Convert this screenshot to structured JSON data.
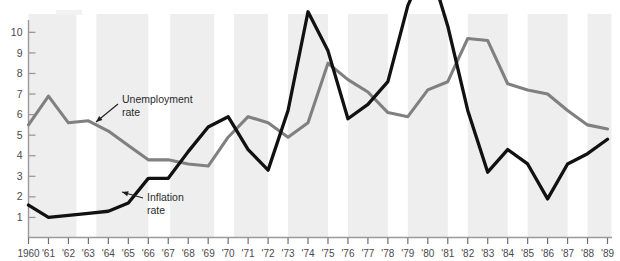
{
  "chart_data": {
    "type": "line",
    "title": "",
    "subtitle": "",
    "xlabel": "",
    "ylabel": "",
    "xlim": [
      1960,
      1989
    ],
    "ylim": [
      0,
      10.6
    ],
    "grid": false,
    "legend_position": "inline-annotations",
    "x": [
      1960,
      1961,
      1962,
      1963,
      1964,
      1965,
      1966,
      1967,
      1968,
      1969,
      1970,
      1971,
      1972,
      1973,
      1974,
      1975,
      1976,
      1977,
      1978,
      1979,
      1980,
      1981,
      1982,
      1983,
      1984,
      1985,
      1986,
      1987,
      1988,
      1989
    ],
    "xtick_labels": [
      "1960",
      "'61",
      "'62",
      "'63",
      "'64",
      "'65",
      "'66",
      "'67",
      "'68",
      "'69",
      "'70",
      "'71",
      "'72",
      "'73",
      "'74",
      "'75",
      "'76",
      "'77",
      "'78",
      "'79",
      "'80",
      "'81",
      "'82",
      "'83",
      "'84",
      "'85",
      "'86",
      "'87",
      "'88",
      "'89"
    ],
    "ytick_labels": [
      "1",
      "2",
      "3",
      "4",
      "5",
      "6",
      "7",
      "8",
      "9",
      "10"
    ],
    "ytick_values": [
      1,
      2,
      3,
      4,
      5,
      6,
      7,
      8,
      9,
      10
    ],
    "series": [
      {
        "name": "Unemployment rate",
        "color": "#808080",
        "values": [
          5.5,
          6.9,
          5.6,
          5.7,
          5.2,
          4.5,
          3.8,
          3.8,
          3.6,
          3.5,
          4.9,
          5.9,
          5.6,
          4.9,
          5.6,
          8.5,
          7.7,
          7.1,
          6.1,
          5.9,
          7.2,
          7.6,
          9.7,
          9.6,
          7.5,
          7.2,
          7.0,
          6.2,
          5.5,
          5.3
        ]
      },
      {
        "name": "Inflation rate",
        "color": "#111111",
        "values": [
          1.6,
          1.0,
          1.1,
          1.2,
          1.3,
          1.7,
          2.9,
          2.9,
          4.2,
          5.4,
          5.9,
          4.3,
          3.3,
          6.2,
          11.0,
          9.1,
          5.8,
          6.5,
          7.6,
          11.3,
          13.5,
          10.3,
          6.2,
          3.2,
          4.3,
          3.6,
          1.9,
          3.6,
          4.1,
          4.8
        ]
      }
    ],
    "shaded_bands": [
      {
        "start": 1960.0,
        "end": 1962.4
      },
      {
        "start": 1963.4,
        "end": 1966.0
      },
      {
        "start": 1967.1,
        "end": 1969.3
      },
      {
        "start": 1970.3,
        "end": 1972.0
      },
      {
        "start": 1973.0,
        "end": 1975.0
      },
      {
        "start": 1976.0,
        "end": 1978.0
      },
      {
        "start": 1979.0,
        "end": 1981.0
      },
      {
        "start": 1982.0,
        "end": 1984.0
      },
      {
        "start": 1985.0,
        "end": 1987.0
      },
      {
        "start": 1988.0,
        "end": 1989.2
      }
    ],
    "annotations": [
      {
        "name": "unemployment-rate",
        "line1": "Unemployment",
        "line2": "rate",
        "text_x": 122,
        "text_y": 103,
        "arrow_from_x": 118,
        "arrow_from_y": 104,
        "arrow_to_x": 96,
        "arrow_to_y": 122
      },
      {
        "name": "inflation-rate",
        "line1": "Inflation",
        "line2": "rate",
        "text_x": 147,
        "text_y": 201,
        "arrow_from_x": 143,
        "arrow_from_y": 198,
        "arrow_to_x": 122,
        "arrow_to_y": 192
      }
    ],
    "colors": {
      "unemployment": "#808080",
      "inflation": "#111111",
      "band": "#eeeeee",
      "axis": "#9a9a9a",
      "text": "#4a4a4a"
    }
  }
}
